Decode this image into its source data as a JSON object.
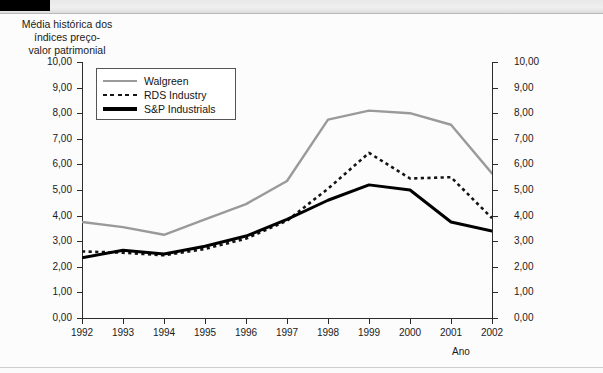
{
  "chart_title": "Média histórica dos\níndices preço-\nvalor patrimonial",
  "axis": {
    "x_caption": "Ano",
    "y_ticks": [
      "10,00",
      "9,00",
      "8,00",
      "7,00",
      "6,00",
      "5,00",
      "4,00",
      "3,00",
      "2,00",
      "1,00",
      "0,00"
    ],
    "x_ticks": [
      "1992",
      "1993",
      "1994",
      "1995",
      "1996",
      "1997",
      "1998",
      "1999",
      "2000",
      "2001",
      "2002"
    ]
  },
  "legend": {
    "items": [
      {
        "label": "Walgreen",
        "style": "solid-gray",
        "color": "#9a9a9a"
      },
      {
        "label": "RDS Industry",
        "style": "dotted-black",
        "color": "#141414"
      },
      {
        "label": "S&P Industrials",
        "style": "solid-black-thick",
        "color": "#000000"
      }
    ]
  },
  "chart_data": {
    "type": "line",
    "xlabel": "Ano",
    "ylabel": "",
    "ylim": [
      0,
      10
    ],
    "ytick_labels": [
      "0,00",
      "1,00",
      "2,00",
      "3,00",
      "4,00",
      "5,00",
      "6,00",
      "7,00",
      "8,00",
      "9,00",
      "10,00"
    ],
    "grid": false,
    "legend_position": "top-left-inside",
    "dual_y_axis": true,
    "categories": [
      "1992",
      "1993",
      "1994",
      "1995",
      "1996",
      "1997",
      "1998",
      "1999",
      "2000",
      "2001",
      "2002"
    ],
    "series": [
      {
        "name": "Walgreen",
        "color": "#9a9a9a",
        "style": "solid",
        "values": [
          3.75,
          3.55,
          3.25,
          3.85,
          4.45,
          5.35,
          7.75,
          8.1,
          8.0,
          7.55,
          5.65
        ]
      },
      {
        "name": "RDS Industry",
        "color": "#141414",
        "style": "dotted",
        "values": [
          2.6,
          2.55,
          2.45,
          2.7,
          3.1,
          3.8,
          5.05,
          6.45,
          5.45,
          5.5,
          3.9
        ]
      },
      {
        "name": "S&P Industrials",
        "color": "#000000",
        "style": "solid-thick",
        "values": [
          2.35,
          2.65,
          2.5,
          2.8,
          3.2,
          3.85,
          4.6,
          5.2,
          5.0,
          3.75,
          3.4
        ]
      }
    ]
  }
}
